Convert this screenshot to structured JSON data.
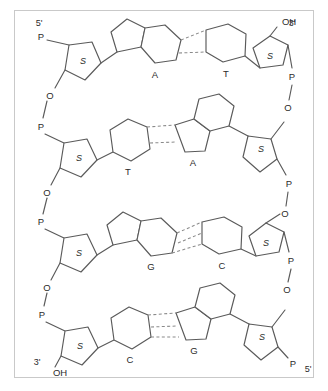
{
  "figure": {
    "type": "chemical-structure-diagram",
    "width": 328,
    "height": 391,
    "background_color": "#ffffff",
    "frame_color": "#c9c9c9",
    "bond_color": "#5a5a5a",
    "hbond_color": "#8a8a8a",
    "text_color": "#2b2b2b"
  },
  "termini": {
    "left_top": "5'",
    "right_top": "3'",
    "left_bottom": "3'",
    "right_bottom": "5'"
  },
  "labels": {
    "phosphate": "P",
    "oxygen": "O",
    "sugar": "S",
    "hydroxyl": "OH"
  },
  "strands": {
    "left": {
      "direction": "5' to 3'",
      "start_label": "5'",
      "end_label": "3'",
      "bases": [
        "A",
        "T",
        "G",
        "C"
      ]
    },
    "right": {
      "direction": "3' to 5'",
      "start_label": "3'",
      "end_label": "5'",
      "bases": [
        "T",
        "A",
        "C",
        "G"
      ]
    }
  },
  "base_pairs": [
    {
      "index": 1,
      "left_base": "A",
      "right_base": "T",
      "hydrogen_bonds": 2,
      "left_base_type": "purine",
      "right_base_type": "pyrimidine"
    },
    {
      "index": 2,
      "left_base": "T",
      "right_base": "A",
      "hydrogen_bonds": 2,
      "left_base_type": "pyrimidine",
      "right_base_type": "purine"
    },
    {
      "index": 3,
      "left_base": "G",
      "right_base": "C",
      "hydrogen_bonds": 3,
      "left_base_type": "purine",
      "right_base_type": "pyrimidine"
    },
    {
      "index": 4,
      "left_base": "C",
      "right_base": "G",
      "hydrogen_bonds": 3,
      "left_base_type": "pyrimidine",
      "right_base_type": "purine"
    }
  ],
  "backbone": {
    "left_atoms": [
      "P",
      "S",
      "O",
      "P",
      "S",
      "O",
      "P",
      "S",
      "O",
      "P",
      "S",
      "OH"
    ],
    "right_atoms": [
      "OH",
      "S",
      "P",
      "O",
      "S",
      "P",
      "O",
      "S",
      "P",
      "O",
      "S",
      "P"
    ]
  },
  "row_labels": {
    "row1": {
      "left": "A",
      "right": "T"
    },
    "row2": {
      "left": "T",
      "right": "A"
    },
    "row3": {
      "left": "G",
      "right": "C"
    },
    "row4": {
      "left": "C",
      "right": "G"
    }
  }
}
